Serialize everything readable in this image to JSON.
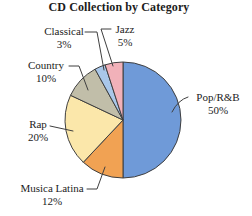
{
  "chart_data": {
    "type": "pie",
    "title": "CD Collection by Category",
    "direction": "clockwise",
    "start_angle_deg": 0,
    "legend": "none",
    "slices": [
      {
        "label": "Pop/R&B",
        "value": 50,
        "pct": "50%",
        "color": "#6f9ad8"
      },
      {
        "label": "Musica Latina",
        "value": 12,
        "pct": "12%",
        "color": "#f1a253"
      },
      {
        "label": "Rap",
        "value": 20,
        "pct": "20%",
        "color": "#fbe7aa"
      },
      {
        "label": "Country",
        "value": 10,
        "pct": "10%",
        "color": "#c1bea9"
      },
      {
        "label": "Classical",
        "value": 3,
        "pct": "3%",
        "color": "#a9c7e9"
      },
      {
        "label": "Jazz",
        "value": 5,
        "pct": "5%",
        "color": "#f1b1b9"
      }
    ],
    "layout": {
      "cx": 123,
      "cy": 120,
      "r": 58
    }
  }
}
